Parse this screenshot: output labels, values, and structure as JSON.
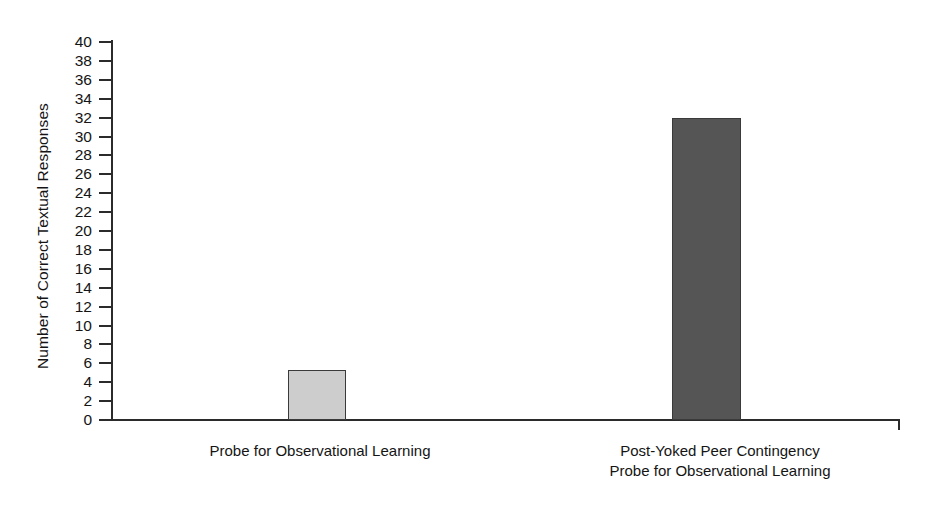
{
  "chart_data": {
    "type": "bar",
    "title": "",
    "xlabel": "",
    "ylabel": "Number of Correct Textual Responses",
    "categories": [
      "Probe for Observational Learning",
      "Post-Yoked Peer Contingency\nProbe for Observational Learning"
    ],
    "values": [
      5.3,
      32
    ],
    "ylim": [
      0,
      40
    ],
    "ytick_step": 2,
    "ytick_labels": [
      "40",
      "38",
      "36",
      "34",
      "32",
      "30",
      "28",
      "26",
      "24",
      "22",
      "20",
      "18",
      "16",
      "14",
      "12",
      "10",
      "8",
      "6",
      "4",
      "2",
      "0"
    ],
    "grid": false,
    "legend": null,
    "bar_colors": [
      "#cdcdcd",
      "#555555"
    ],
    "bar_edge_color": "#3a3a3a",
    "axis_color": "#2b2b2b",
    "background": "#ffffff"
  }
}
